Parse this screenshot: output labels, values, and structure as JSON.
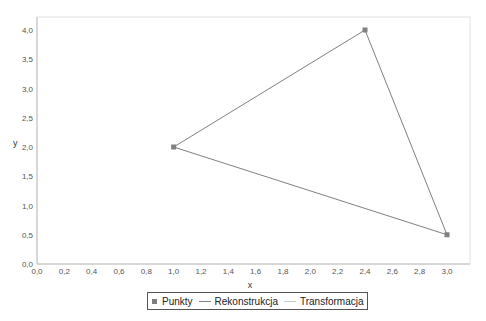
{
  "chart_data": {
    "type": "scatter",
    "title": "",
    "xlabel": "x",
    "ylabel": "y",
    "xlim": [
      0.0,
      3.1
    ],
    "ylim": [
      0.0,
      4.2
    ],
    "x_ticks": [
      "0,0",
      "0,2",
      "0,4",
      "0,6",
      "0,8",
      "1,0",
      "1,2",
      "1,4",
      "1,6",
      "1,8",
      "2,0",
      "2,2",
      "2,4",
      "2,6",
      "2,8",
      "3,0"
    ],
    "y_ticks": [
      "0,0",
      "0,5",
      "1,0",
      "1,5",
      "2,0",
      "2,5",
      "3,0",
      "3,5",
      "4,0"
    ],
    "grid": false,
    "legend_position": "bottom",
    "series": [
      {
        "name": "Punkty",
        "kind": "markers",
        "color": "#808080",
        "points": [
          {
            "x": 1.0,
            "y": 2.0
          },
          {
            "x": 2.4,
            "y": 4.0
          },
          {
            "x": 3.0,
            "y": 0.5
          }
        ]
      },
      {
        "name": "Rekonstrukcja",
        "kind": "line",
        "color": "#808080",
        "points": [
          {
            "x": 1.0,
            "y": 2.0
          },
          {
            "x": 2.4,
            "y": 4.0
          },
          {
            "x": 3.0,
            "y": 0.5
          },
          {
            "x": 1.0,
            "y": 2.0
          }
        ]
      },
      {
        "name": "Transformacja",
        "kind": "line",
        "color": "#c8c8c8",
        "points": []
      }
    ]
  },
  "legend": {
    "items": [
      {
        "label": "Punkty",
        "symbol": "square",
        "color": "#808080"
      },
      {
        "label": "Rekonstrukcja",
        "symbol": "line",
        "color": "#808080"
      },
      {
        "label": "Transformacja",
        "symbol": "line",
        "color": "#c8c8c8"
      }
    ]
  }
}
